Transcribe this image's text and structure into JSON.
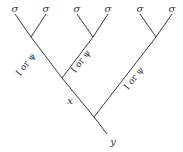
{
  "diagram": {
    "type": "tree",
    "leaves": [
      {
        "label": "σ",
        "x": 15,
        "y": 10
      },
      {
        "label": "σ",
        "x": 46,
        "y": 10
      },
      {
        "label": "σ",
        "x": 77,
        "y": 10
      },
      {
        "label": "σ",
        "x": 108,
        "y": 10
      },
      {
        "label": "σ",
        "x": 140,
        "y": 10
      },
      {
        "label": "σ",
        "x": 172,
        "y": 10
      }
    ],
    "internal_labels": {
      "x": "x",
      "y": "y"
    },
    "edge_labels": [
      {
        "text": "I or ψ",
        "edge": "left-pair-to-mid"
      },
      {
        "text": "I or ψ",
        "edge": "middle-pair-to-mid"
      },
      {
        "text": "I or ψ",
        "edge": "right-pair-to-root"
      }
    ]
  }
}
